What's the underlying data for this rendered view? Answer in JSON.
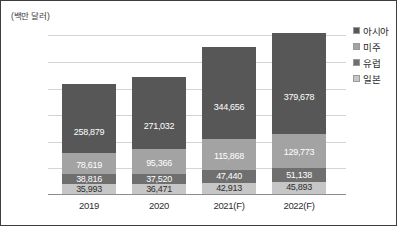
{
  "chart_data": {
    "type": "bar",
    "subtype": "stacked-bar",
    "title": "",
    "xlabel": "",
    "ylabel": "(백만 달러)",
    "y_unit_note": "(백만 달러)",
    "categories": [
      "2019",
      "2020",
      "2021(F)",
      "2022(F)"
    ],
    "series": [
      {
        "name": "아시아",
        "color": "#575757",
        "values": [
          258879,
          271032,
          344656,
          379678
        ],
        "labels": [
          "258,879",
          "271,032",
          "344,656",
          "379,678"
        ]
      },
      {
        "name": "미주",
        "color": "#a3a3a3",
        "values": [
          78619,
          95366,
          115868,
          129773
        ],
        "labels": [
          "78,619",
          "95,366",
          "115,868",
          "129,773"
        ]
      },
      {
        "name": "유럽",
        "color": "#6f6f6f",
        "values": [
          38816,
          37520,
          47440,
          51138
        ],
        "labels": [
          "38,816",
          "37,520",
          "47,440",
          "51,138"
        ]
      },
      {
        "name": "일본",
        "color": "#c6c6c6",
        "values": [
          35993,
          36471,
          42913,
          45893
        ],
        "labels": [
          "35,993",
          "36,471",
          "42,913",
          "45,893"
        ]
      }
    ],
    "stack_order_bottom_to_top": [
      "일본",
      "유럽",
      "미주",
      "아시아"
    ],
    "totals": [
      412307,
      440389,
      550877,
      606482
    ],
    "ylim": [
      0,
      620000
    ],
    "yticks": [
      100000,
      200000,
      300000,
      400000,
      500000,
      600000
    ],
    "ytick_labels": [
      "100,000",
      "200,000",
      "300,000",
      "400,000",
      "500,000",
      "600,000"
    ],
    "grid": true,
    "legend_position": "right"
  },
  "axis": {
    "unit_label": "(백만 달러)",
    "ytick_labels": [
      "600,000",
      "500,000",
      "400,000",
      "300,000",
      "200,000",
      "100,000"
    ],
    "xtick_labels": [
      "2019",
      "2020",
      "2021(F)",
      "2022(F)"
    ]
  },
  "legend": {
    "items": [
      {
        "label": "아시아",
        "color": "#575757"
      },
      {
        "label": "미주",
        "color": "#a3a3a3"
      },
      {
        "label": "유럽",
        "color": "#6f6f6f"
      },
      {
        "label": "일본",
        "color": "#c6c6c6"
      }
    ]
  },
  "bars": [
    {
      "category": "2019",
      "segments": [
        {
          "series": "일본",
          "label": "35,993"
        },
        {
          "series": "유럽",
          "label": "38,816"
        },
        {
          "series": "미주",
          "label": "78,619"
        },
        {
          "series": "아시아",
          "label": "258,879"
        }
      ]
    },
    {
      "category": "2020",
      "segments": [
        {
          "series": "일본",
          "label": "36,471"
        },
        {
          "series": "유럽",
          "label": "37,520"
        },
        {
          "series": "미주",
          "label": "95,366"
        },
        {
          "series": "아시아",
          "label": "271,032"
        }
      ]
    },
    {
      "category": "2021(F)",
      "segments": [
        {
          "series": "일본",
          "label": "42,913"
        },
        {
          "series": "유럽",
          "label": "47,440"
        },
        {
          "series": "미주",
          "label": "115,868"
        },
        {
          "series": "아시아",
          "label": "344,656"
        }
      ]
    },
    {
      "category": "2022(F)",
      "segments": [
        {
          "series": "일본",
          "label": "45,893"
        },
        {
          "series": "유럽",
          "label": "51,138"
        },
        {
          "series": "미주",
          "label": "129,773"
        },
        {
          "series": "아시아",
          "label": "379,678"
        }
      ]
    }
  ]
}
